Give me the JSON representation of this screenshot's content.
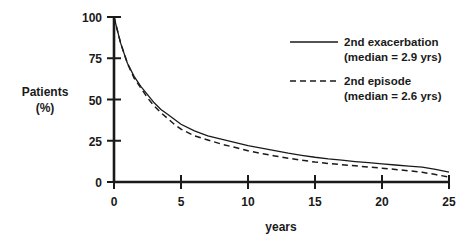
{
  "chart_data": {
    "type": "line",
    "title": "",
    "xlabel": "years",
    "ylabel_line1": "Patients",
    "ylabel_line2": "(%)",
    "xlim": [
      0,
      25
    ],
    "ylim": [
      0,
      100
    ],
    "xticks": [
      "0",
      "5",
      "10",
      "15",
      "20",
      "25"
    ],
    "xtick_values": [
      0,
      5,
      10,
      15,
      20,
      25
    ],
    "yticks": [
      "0",
      "25",
      "50",
      "75",
      "100"
    ],
    "ytick_values": [
      0,
      25,
      50,
      75,
      100
    ],
    "grid": false,
    "legend_position": "upper-right",
    "series": [
      {
        "name": "2nd exacerbation",
        "label_line1": "2nd exacerbation",
        "label_line2": "(median = 2.9 yrs)",
        "median_years": 2.9,
        "style": "solid",
        "color": "#1a1a1a",
        "x": [
          0,
          0.5,
          1,
          1.5,
          2,
          2.5,
          3,
          3.5,
          4,
          4.5,
          5,
          6,
          7,
          8,
          9,
          10,
          11,
          12,
          13,
          14,
          15,
          16,
          17,
          18,
          19,
          20,
          21,
          22,
          23,
          24,
          25
        ],
        "y": [
          100,
          84,
          72,
          64,
          58,
          53,
          48,
          44,
          41,
          38,
          35,
          31,
          28,
          26,
          24,
          22,
          20.5,
          19,
          17.5,
          16.2,
          15,
          14,
          13.2,
          12.4,
          11.7,
          11,
          10.3,
          9.6,
          9,
          7.6,
          6
        ]
      },
      {
        "name": "2nd episode",
        "label_line1": "2nd episode",
        "label_line2": "(median = 2.6 yrs)",
        "median_years": 2.6,
        "style": "dashed",
        "color": "#1a1a1a",
        "x": [
          0,
          0.5,
          1,
          1.5,
          2,
          2.5,
          3,
          3.5,
          4,
          4.5,
          5,
          6,
          7,
          8,
          9,
          10,
          11,
          12,
          13,
          14,
          15,
          16,
          17,
          18,
          19,
          20,
          21,
          22,
          23,
          24,
          25
        ],
        "y": [
          100,
          84,
          72,
          63,
          57,
          51,
          46,
          42,
          38.5,
          35,
          32,
          28,
          25.5,
          23,
          21,
          19,
          17.3,
          15.8,
          14.4,
          13.2,
          12.1,
          11.2,
          10.5,
          9.8,
          9.1,
          8.4,
          7.6,
          6.8,
          5.9,
          4.5,
          3
        ]
      }
    ]
  },
  "axes": {
    "x_axis_name": "x-axis",
    "y_axis_name": "y-axis"
  }
}
